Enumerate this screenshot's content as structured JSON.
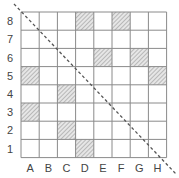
{
  "diagram": {
    "columns": [
      "A",
      "B",
      "C",
      "D",
      "E",
      "F",
      "G",
      "H"
    ],
    "rows": [
      "8",
      "7",
      "6",
      "5",
      "4",
      "3",
      "2",
      "1"
    ],
    "shaded_cells": [
      "D8",
      "F8",
      "E6",
      "G6",
      "A5",
      "H5",
      "C4",
      "A3",
      "C2",
      "D1"
    ],
    "diagonal": {
      "style": "dashed",
      "from": "top-left",
      "to": "bottom-right"
    },
    "colors": {
      "grid": "#8a8a8a",
      "shade": "#b5b5b5",
      "diagonal": "#555555",
      "label": "#444444"
    }
  }
}
